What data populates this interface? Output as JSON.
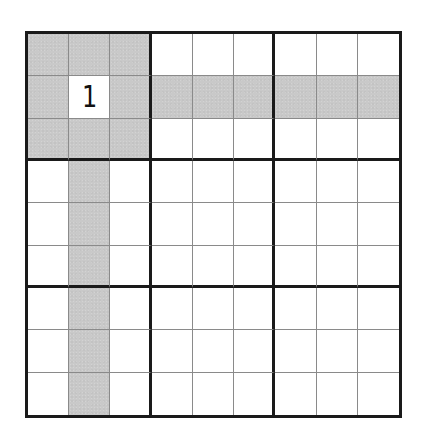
{
  "puzzle": {
    "type": "sudoku",
    "size": 9,
    "box_size": 3,
    "colors": {
      "shade": "#c9c9c9",
      "thick_line": "#1a1a1a",
      "thin_line": "#8a8a8a",
      "background": "#ffffff",
      "digit": "#111111"
    },
    "givens": [
      {
        "row": 1,
        "col": 1,
        "value": "1"
      }
    ],
    "highlight": {
      "box": {
        "row": 0,
        "col": 0
      },
      "row": 1,
      "col": 1,
      "excluded_cell": {
        "row": 1,
        "col": 1
      }
    },
    "grid": [
      [
        "",
        "",
        "",
        "",
        "",
        "",
        "",
        "",
        ""
      ],
      [
        "",
        "1",
        "",
        "",
        "",
        "",
        "",
        "",
        ""
      ],
      [
        "",
        "",
        "",
        "",
        "",
        "",
        "",
        "",
        ""
      ],
      [
        "",
        "",
        "",
        "",
        "",
        "",
        "",
        "",
        ""
      ],
      [
        "",
        "",
        "",
        "",
        "",
        "",
        "",
        "",
        ""
      ],
      [
        "",
        "",
        "",
        "",
        "",
        "",
        "",
        "",
        ""
      ],
      [
        "",
        "",
        "",
        "",
        "",
        "",
        "",
        "",
        ""
      ],
      [
        "",
        "",
        "",
        "",
        "",
        "",
        "",
        "",
        ""
      ],
      [
        "",
        "",
        "",
        "",
        "",
        "",
        "",
        "",
        ""
      ]
    ]
  }
}
